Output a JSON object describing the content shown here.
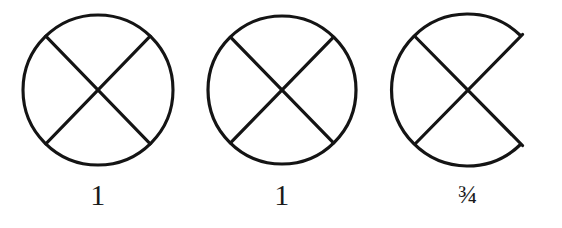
{
  "page": {
    "background_color": "#ffffff",
    "ink_color": "#141414",
    "width": 562,
    "height": 228
  },
  "figures": [
    {
      "id": "figure-1",
      "name": "circle-with-x-complete-left",
      "caption": "1",
      "caption_kind": "integer",
      "arc_complete": true,
      "description": "Closed circle with two crossing diagonal chords forming an X"
    },
    {
      "id": "figure-2",
      "name": "circle-with-x-complete-middle",
      "caption": "1",
      "caption_kind": "integer",
      "arc_complete": true,
      "description": "Closed circle with two crossing diagonal chords forming an X"
    },
    {
      "id": "figure-3",
      "name": "circle-with-x-open-right",
      "caption": "¾",
      "caption_kind": "fraction",
      "arc_complete": false,
      "description": "Circle missing the right arc segment; the two chords meet the arc ends at sharp corners"
    }
  ]
}
